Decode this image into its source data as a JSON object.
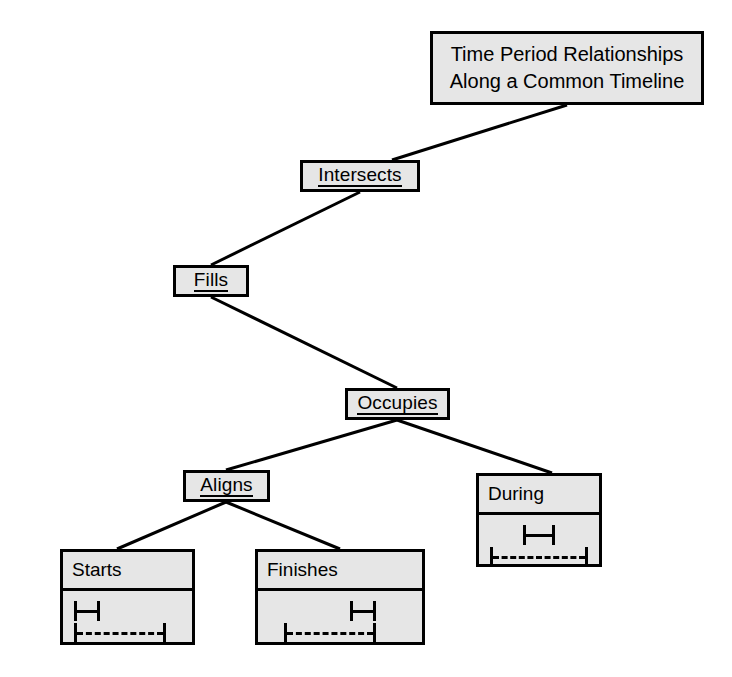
{
  "diagram": {
    "type": "hierarchy-tree",
    "title_node": {
      "name": "time-period-relationships",
      "lines": [
        "Time Period Relationships",
        "Along a Common Timeline"
      ],
      "underlined": false
    },
    "nodes": [
      {
        "id": "intersects",
        "label": "Intersects",
        "underlined": true,
        "kind": "simple"
      },
      {
        "id": "fills",
        "label": "Fills",
        "underlined": true,
        "kind": "simple"
      },
      {
        "id": "occupies",
        "label": "Occupies",
        "underlined": true,
        "kind": "simple"
      },
      {
        "id": "aligns",
        "label": "Aligns",
        "underlined": true,
        "kind": "simple"
      },
      {
        "id": "during",
        "label": "During",
        "underlined": false,
        "kind": "compartment",
        "timeline": {
          "short_bar": "|-|",
          "long_bar": "|------------|",
          "short_alignment": "center",
          "long_alignment": "center"
        }
      },
      {
        "id": "starts",
        "label": "Starts",
        "underlined": false,
        "kind": "compartment",
        "timeline": {
          "short_bar": "|-|",
          "long_bar": "|------------|",
          "short_alignment": "left",
          "long_alignment": "left"
        }
      },
      {
        "id": "finishes",
        "label": "Finishes",
        "underlined": false,
        "kind": "compartment",
        "timeline": {
          "short_bar": "|-|",
          "long_bar": "|------------|",
          "short_alignment": "right",
          "long_alignment": "right"
        }
      }
    ],
    "edges": [
      {
        "from": "time-period-relationships",
        "to": "intersects"
      },
      {
        "from": "intersects",
        "to": "fills"
      },
      {
        "from": "fills",
        "to": "occupies"
      },
      {
        "from": "occupies",
        "to": "aligns"
      },
      {
        "from": "occupies",
        "to": "during"
      },
      {
        "from": "aligns",
        "to": "starts"
      },
      {
        "from": "aligns",
        "to": "finishes"
      }
    ],
    "colors": {
      "node_fill": "#e6e6e6",
      "node_border": "#000000",
      "edge": "#000000",
      "text": "#000000",
      "background": "#ffffff"
    }
  }
}
